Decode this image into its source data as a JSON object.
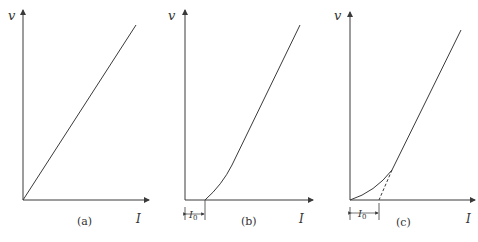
{
  "panels": [
    {
      "id": "a",
      "caption": "(a)",
      "y_label": "v",
      "x_label": "I",
      "description": "Linear v-I relationship through origin"
    },
    {
      "id": "b",
      "caption": "(b)",
      "y_label": "v",
      "x_label": "I",
      "offset_label": "I",
      "offset_sub": "0",
      "description": "Curve starting at I0 on the I axis, becoming linear"
    },
    {
      "id": "c",
      "caption": "(c)",
      "y_label": "v",
      "x_label": "I",
      "offset_label": "I",
      "offset_sub": "0",
      "description": "Curve from origin, linear portion extrapolated (dashed) to intercept I0"
    }
  ],
  "colors": {
    "line": "#3a3a3a",
    "axis": "#3a3a3a",
    "background": "#ffffff"
  }
}
